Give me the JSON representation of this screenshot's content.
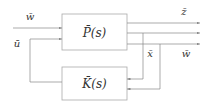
{
  "diagram": {
    "type": "block-diagram",
    "blocks": [
      {
        "id": "plant",
        "label": "P̄(s)"
      },
      {
        "id": "controller",
        "label": "K̄(s)"
      }
    ],
    "signals": {
      "input_w": "w̄",
      "input_u": "ū",
      "output_z": "z̄",
      "output_x": "x̄",
      "output_w": "w̄"
    },
    "colors": {
      "line": "#888888",
      "box": "#aaaaaa",
      "text": "#333333"
    }
  }
}
